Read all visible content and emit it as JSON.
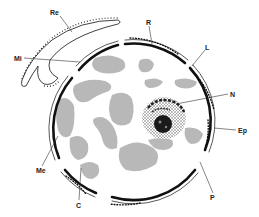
{
  "figure": {
    "colors": {
      "background": "#ffffff",
      "ink": "#111111",
      "cytoplasm_patches": "#b4b4b4",
      "nucleus_stipple": "#6a6a6a",
      "nucleolus": "#1a1a1a"
    },
    "labels": {
      "re": "Re",
      "r": "R",
      "mi": "Mi",
      "l": "L",
      "n": "N",
      "ep": "Ep",
      "me": "Me",
      "c": "C",
      "p": "P"
    }
  }
}
